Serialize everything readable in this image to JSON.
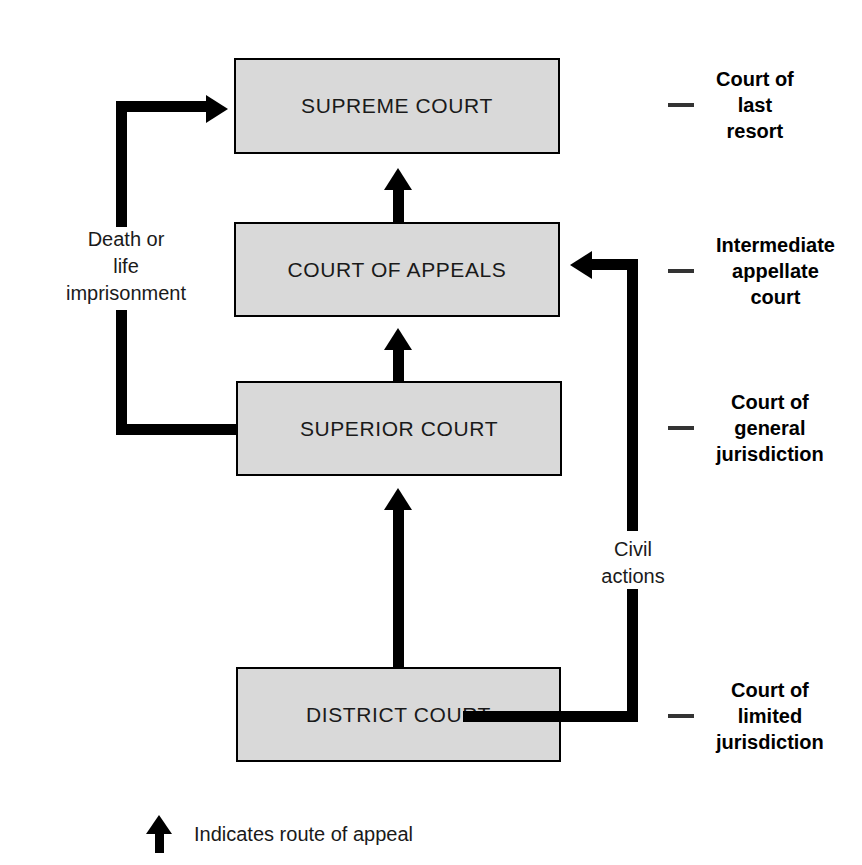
{
  "diagram": {
    "colors": {
      "box_fill": "#d9d9d9",
      "box_border": "#000000",
      "connector": "#000000",
      "bracket": "#333333",
      "background": "#ffffff"
    }
  },
  "courts": [
    {
      "id": "supreme",
      "label": "SUPREME COURT"
    },
    {
      "id": "appeals",
      "label": "COURT OF APPEALS"
    },
    {
      "id": "superior",
      "label": "SUPERIOR COURT"
    },
    {
      "id": "district",
      "label": "DISTRICT COURT"
    }
  ],
  "side_annotations": [
    {
      "id": "last-resort",
      "line1": "Court of",
      "line2": "last",
      "line3": "resort"
    },
    {
      "id": "intermediate",
      "line1": "Intermediate",
      "line2": "appellate",
      "line3": "court"
    },
    {
      "id": "general",
      "line1": "Court of",
      "line2": "general",
      "line3": "jurisdiction"
    },
    {
      "id": "limited",
      "line1": "Court of",
      "line2": "limited",
      "line3": "jurisdiction"
    }
  ],
  "route_captions": {
    "death": {
      "line1": "Death or",
      "line2": "life",
      "line3": "imprisonment"
    },
    "civil": {
      "line1": "Civil",
      "line2": "actions"
    }
  },
  "legend": {
    "icon": "up-arrow-icon",
    "text": "Indicates route of appeal"
  }
}
